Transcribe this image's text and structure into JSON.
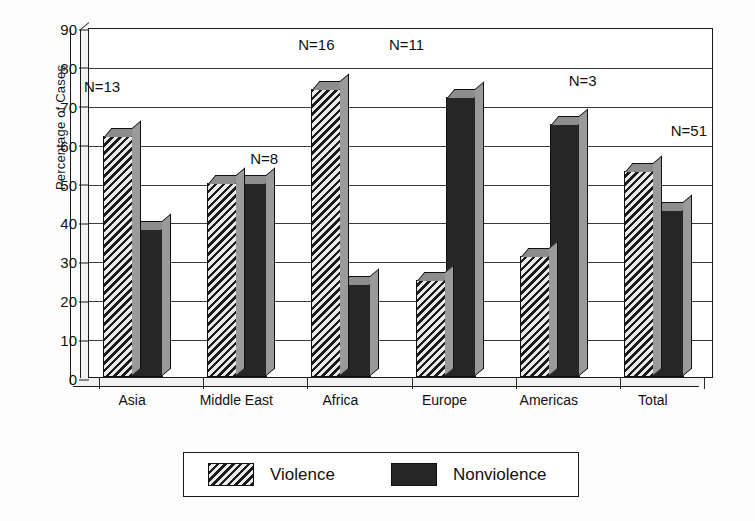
{
  "chart_data": {
    "type": "bar",
    "title": "",
    "xlabel": "",
    "ylabel": "Percentage of Cases",
    "ylim": [
      0,
      90
    ],
    "ytick_labels": [
      "0",
      "10",
      "20",
      "30",
      "40",
      "50",
      "60",
      "70",
      "80",
      "90"
    ],
    "ytick_values": [
      0,
      10,
      20,
      30,
      40,
      50,
      60,
      70,
      80,
      90
    ],
    "grid": true,
    "legend_position": "bottom",
    "categories": [
      "Asia",
      "Middle East",
      "Africa",
      "Europe",
      "Americas",
      "Total"
    ],
    "annotations": [
      "N=13",
      "N=8",
      "N=16",
      "N=11",
      "N=3",
      "N=51"
    ],
    "series": [
      {
        "name": "Violence",
        "color": "#3a3a3a",
        "pattern": "diagonal-hatch",
        "values": [
          62,
          50,
          74,
          25,
          31,
          53
        ]
      },
      {
        "name": "Nonviolence",
        "color": "#262626",
        "pattern": "solid",
        "values": [
          38,
          50,
          24,
          72,
          65,
          43
        ]
      }
    ]
  },
  "legend": {
    "items": [
      {
        "label": "Violence",
        "swatch": "violence"
      },
      {
        "label": "Nonviolence",
        "swatch": "nonviolence"
      }
    ]
  }
}
